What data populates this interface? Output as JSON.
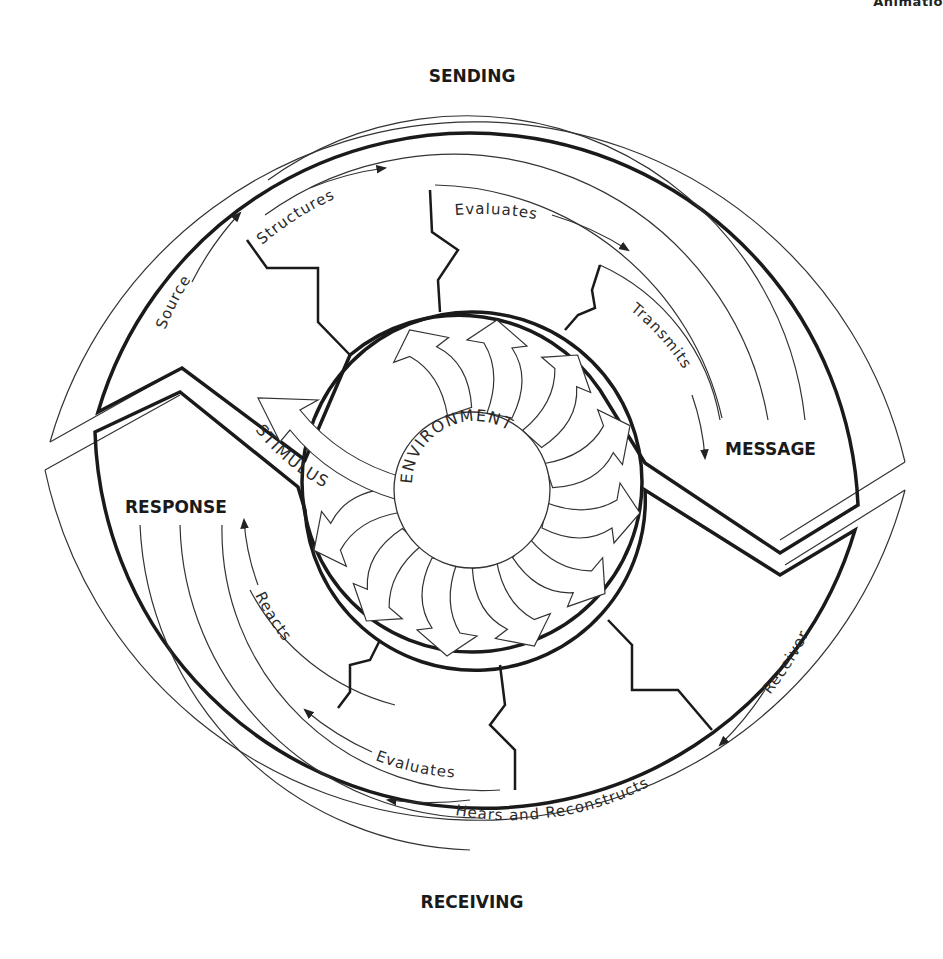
{
  "page_header_fragment": "Animatio",
  "diagram": {
    "title_top": "SENDING",
    "title_bottom": "RECEIVING",
    "center_label": "ENVIRONMENT",
    "stimulus_label": "STIMULUS",
    "message_label": "MESSAGE",
    "response_label": "RESPONSE",
    "sending_steps": [
      "Source",
      "Structures",
      "Evaluates",
      "Transmits"
    ],
    "receiving_steps": [
      "Receiver",
      "Hears and Reconstructs",
      "Evaluates",
      "Reacts"
    ],
    "colors": {
      "stroke": "#1a1a1a",
      "background": "#ffffff"
    }
  }
}
